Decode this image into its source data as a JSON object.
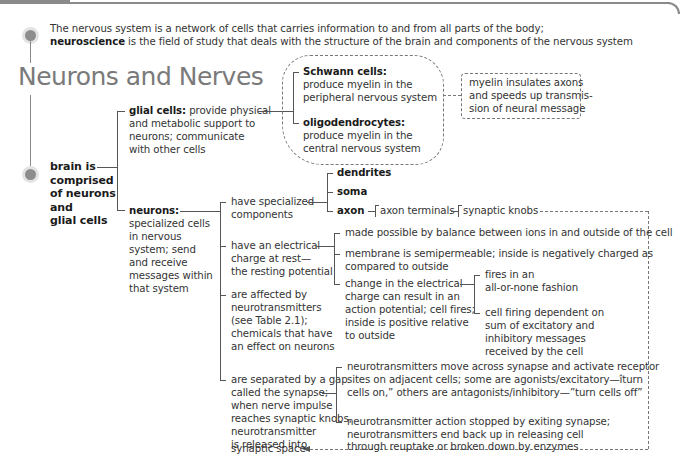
{
  "header": {
    "intro_line1": "The nervous system is a network of cells that carries information to and from all parts of the body;",
    "intro_term": "neuroscience",
    "intro_line2_rest": " is the field of study that deals with the structure of the brain and components of the nervous system",
    "title": "Neurons and Nerves"
  },
  "root": {
    "label_lines": [
      "brain is",
      "comprised",
      "of neurons",
      "and",
      "glial cells"
    ]
  },
  "glial": {
    "term": "glial cells:",
    "desc_first": " provide physical",
    "desc_lines": [
      "and metabolic support to",
      "neurons; communicate",
      "with other cells"
    ],
    "types": [
      {
        "term": "Schwann cells:",
        "lines": [
          "produce myelin in the",
          "peripheral nervous system"
        ]
      },
      {
        "term": "oligodendrocytes:",
        "lines": [
          "produce myelin in the",
          "central nervous system"
        ]
      }
    ],
    "note_lines": [
      "myelin insulates axons",
      "and speeds up transmis-",
      "sion of neural message"
    ]
  },
  "neurons": {
    "term": "neurons:",
    "desc_lines": [
      "specialized cells",
      "in nervous",
      "system; send",
      "and receive",
      "messages within",
      "that system"
    ],
    "branches": [
      {
        "lines": [
          "have specialized",
          "components"
        ]
      },
      {
        "lines": [
          "have an electrical",
          "charge at rest—",
          "the resting potential"
        ]
      },
      {
        "lines": [
          "are affected by",
          "neurotransmitters",
          "(see Table 2.1);",
          "chemicals that have",
          "an effect on neurons"
        ]
      },
      {
        "lines": [
          "are separated by a gap",
          "called the synapse;",
          "when nerve impulse",
          "reaches synaptic knobs,",
          "neurotransmitter",
          "is released into",
          "synaptic space"
        ]
      }
    ],
    "components": [
      "dendrites",
      "soma",
      "axon"
    ],
    "axon_chain": [
      "axon terminals",
      "synaptic knobs"
    ],
    "resting": [
      {
        "lines": [
          "made possible by balance between ions in and outside of the cell"
        ]
      },
      {
        "lines": [
          "membrane is semipermeable; inside is negatively charged as",
          "compared to outside"
        ]
      },
      {
        "lines": [
          "change in the electrical",
          "charge can result in an",
          "action potential; cell fires;",
          "inside is positive relative",
          "to outside"
        ]
      }
    ],
    "firing": [
      {
        "lines": [
          "fires in an",
          "all-or-none fashion"
        ]
      },
      {
        "lines": [
          "cell firing dependent on",
          "sum of excitatory and",
          "inhibitory messages",
          "received by the cell"
        ]
      }
    ],
    "synapse": [
      {
        "lines": [
          "neurotransmitters move across synapse and activate receptor",
          "sites on adjacent cells; some are agonists/excitatory—îturn",
          "cells on,” others are antagonists/inhibitory—”turn cells off”"
        ]
      },
      {
        "lines": [
          "neurotransmitter action stopped by exiting synapse;",
          "neurotransmitters end back up in releasing cell",
          "through reuptake or broken down by enzymes"
        ]
      }
    ]
  },
  "colors": {
    "title_gray": "#7a7a7a",
    "line": "#555555",
    "dot": "#8d8d8d",
    "text": "#333333"
  }
}
